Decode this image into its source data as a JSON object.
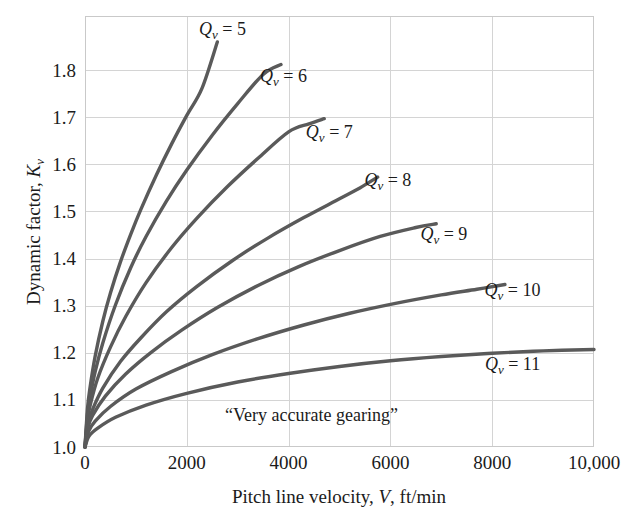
{
  "chart_data": {
    "type": "line",
    "title": "",
    "xlabel": "Pitch line velocity, V, ft/min",
    "ylabel": "Dynamic factor, K_v",
    "xlim": [
      0,
      10000
    ],
    "ylim": [
      1.0,
      1.915
    ],
    "grid": true,
    "legend_position": "inline-end-of-curve",
    "x_ticks": [
      0,
      2000,
      4000,
      6000,
      8000,
      10000
    ],
    "x_tick_labels": [
      "0",
      "2000",
      "4000",
      "6000",
      "8000",
      "10,000"
    ],
    "y_ticks": [
      1.0,
      1.1,
      1.2,
      1.3,
      1.4,
      1.5,
      1.6,
      1.7,
      1.8
    ],
    "y_tick_labels": [
      "1.0",
      "1.1",
      "1.2",
      "1.3",
      "1.4",
      "1.5",
      "1.6",
      "1.7",
      "1.8"
    ],
    "annotations": [
      {
        "text": "“Very accurate gearing”",
        "x": 4450,
        "y": 1.055
      }
    ],
    "series": [
      {
        "name": "Q_v = 5",
        "label_prefix": "Q",
        "label_sub": "v",
        "label_value": "= 5",
        "label_at": {
          "x": 2700,
          "y": 1.875
        },
        "x": [
          0,
          50,
          100,
          200,
          350,
          500,
          700,
          900,
          1100,
          1400,
          1700,
          2000,
          2300,
          2600
        ],
        "y": [
          1.0,
          1.083,
          1.127,
          1.193,
          1.267,
          1.327,
          1.394,
          1.452,
          1.505,
          1.577,
          1.643,
          1.704,
          1.762,
          1.86
        ]
      },
      {
        "name": "Q_v = 6",
        "label_prefix": "Q",
        "label_sub": "v",
        "label_value": "= 6",
        "label_at": {
          "x": 3900,
          "y": 1.775
        },
        "x": [
          0,
          50,
          100,
          200,
          350,
          600,
          900,
          1200,
          1600,
          2000,
          2500,
          3000,
          3500,
          3850
        ],
        "y": [
          1.0,
          1.07,
          1.106,
          1.16,
          1.221,
          1.302,
          1.381,
          1.447,
          1.522,
          1.588,
          1.662,
          1.729,
          1.791,
          1.812
        ]
      },
      {
        "name": "Q_v = 7",
        "label_prefix": "Q",
        "label_sub": "v",
        "label_value": "= 7",
        "label_at": {
          "x": 4800,
          "y": 1.655
        },
        "x": [
          0,
          50,
          100,
          250,
          500,
          800,
          1200,
          1700,
          2200,
          2800,
          3400,
          4000,
          4400,
          4700
        ],
        "y": [
          1.0,
          1.058,
          1.088,
          1.146,
          1.212,
          1.277,
          1.349,
          1.423,
          1.486,
          1.553,
          1.613,
          1.669,
          1.686,
          1.697
        ]
      },
      {
        "name": "Q_v = 8",
        "label_prefix": "Q",
        "label_sub": "v",
        "label_value": "= 8",
        "label_at": {
          "x": 5950,
          "y": 1.555
        },
        "x": [
          0,
          60,
          150,
          350,
          700,
          1100,
          1600,
          2200,
          2900,
          3600,
          4300,
          5000,
          5400,
          5750
        ],
        "y": [
          1.0,
          1.05,
          1.08,
          1.125,
          1.182,
          1.232,
          1.287,
          1.341,
          1.396,
          1.444,
          1.487,
          1.527,
          1.55,
          1.573
        ]
      },
      {
        "name": "Q_v = 9",
        "label_prefix": "Q",
        "label_sub": "v",
        "label_value": "= 9",
        "label_at": {
          "x": 7050,
          "y": 1.44
        },
        "x": [
          0,
          60,
          150,
          400,
          800,
          1300,
          1900,
          2600,
          3400,
          4200,
          5000,
          5800,
          6500,
          6900
        ],
        "y": [
          1.0,
          1.042,
          1.067,
          1.108,
          1.155,
          1.201,
          1.248,
          1.296,
          1.343,
          1.383,
          1.417,
          1.447,
          1.466,
          1.474
        ]
      },
      {
        "name": "Q_v = 10",
        "label_prefix": "Q",
        "label_sub": "v",
        "label_value": "= 10",
        "label_at": {
          "x": 8400,
          "y": 1.32
        },
        "x": [
          0,
          70,
          200,
          500,
          1000,
          1700,
          2500,
          3400,
          4300,
          5200,
          6100,
          7000,
          7700,
          8250
        ],
        "y": [
          1.0,
          1.033,
          1.055,
          1.086,
          1.123,
          1.16,
          1.196,
          1.23,
          1.259,
          1.284,
          1.305,
          1.323,
          1.335,
          1.345
        ]
      },
      {
        "name": "Q_v = 11",
        "label_prefix": "Q",
        "label_sub": "v",
        "label_value": "= 11",
        "label_at": {
          "x": 8400,
          "y": 1.163
        },
        "x": [
          0,
          80,
          250,
          600,
          1200,
          2000,
          3000,
          4000,
          5000,
          6000,
          7000,
          8000,
          9000,
          10000
        ],
        "y": [
          1.0,
          1.023,
          1.04,
          1.063,
          1.089,
          1.114,
          1.138,
          1.156,
          1.171,
          1.183,
          1.192,
          1.199,
          1.204,
          1.207
        ]
      }
    ]
  },
  "colors": {
    "curve": "#5a5a5a",
    "grid": "#d4d4d4",
    "frame": "#c9c9c9",
    "text": "#1b1b1b",
    "background": "#ffffff"
  }
}
